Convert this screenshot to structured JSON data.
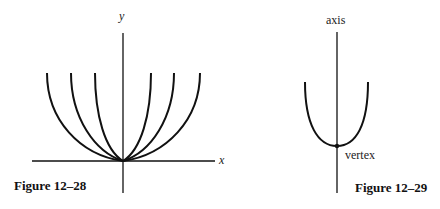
{
  "figure_28": {
    "caption": "Figure 12–28",
    "y_label": "y",
    "x_label": "x",
    "curve_count": 6,
    "description": "Family of parabolas with vertex at origin, opening upward, varying widths"
  },
  "figure_29": {
    "caption": "Figure 12–29",
    "axis_label": "axis",
    "vertex_label": "vertex",
    "description": "Single parabola with vertical axis of symmetry and marked vertex"
  },
  "colors": {
    "ink": "#111111",
    "background": "#ffffff"
  }
}
